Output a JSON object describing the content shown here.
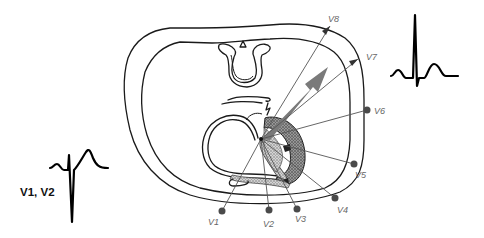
{
  "diagram": {
    "type": "chest-cross-section-ecg-leads",
    "colors": {
      "outline": "#1a1a1a",
      "lead_line": "#555555",
      "lead_dot": "#4a4a4a",
      "lead_label": "#666666",
      "vector_arrow": "#7a7a7a",
      "myocardium_fill": "#9a9a9a",
      "ecg_trace": "#000000"
    },
    "leads": [
      {
        "id": "V1",
        "label": "V1"
      },
      {
        "id": "V2",
        "label": "V2"
      },
      {
        "id": "V3",
        "label": "V3"
      },
      {
        "id": "V4",
        "label": "V4"
      },
      {
        "id": "V5",
        "label": "V5"
      },
      {
        "id": "V6",
        "label": "V6"
      },
      {
        "id": "V7",
        "label": "V7"
      },
      {
        "id": "V8",
        "label": "V8"
      }
    ],
    "ecg_traces": {
      "right_precordial_label": "V1, V2",
      "left_lateral_label": ""
    },
    "icons": {
      "vector_arrow": "depolarization-vector-arrow",
      "sternum": "sternum-triangle"
    }
  }
}
